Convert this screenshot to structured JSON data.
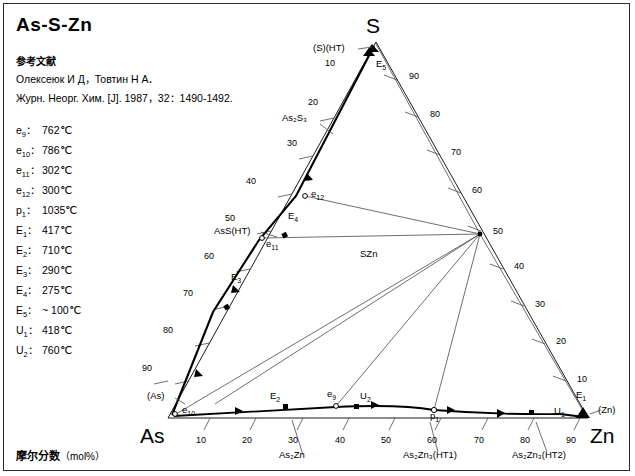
{
  "title": "As-S-Zn",
  "reference": {
    "heading": "参考文献",
    "line1": "Олексеюк И Д，Товтин Н А．",
    "line2": "Журн. Неорг. Хим. [J]. 1987，32：1490-1492."
  },
  "caption": {
    "text": "摩尔分数",
    "unit": "（mol%）"
  },
  "legend": [
    {
      "label": "e",
      "sub": "9",
      "value": "762℃"
    },
    {
      "label": "e",
      "sub": "10",
      "value": "786℃"
    },
    {
      "label": "e",
      "sub": "11",
      "value": "302℃"
    },
    {
      "label": "e",
      "sub": "12",
      "value": "300℃"
    },
    {
      "label": "p",
      "sub": "1",
      "value": "1035℃"
    },
    {
      "label": "E",
      "sub": "1",
      "value": "417℃"
    },
    {
      "label": "E",
      "sub": "2",
      "value": "710℃"
    },
    {
      "label": "E",
      "sub": "3",
      "value": "290℃"
    },
    {
      "label": "E",
      "sub": "4",
      "value": "275℃"
    },
    {
      "label": "E",
      "sub": "5",
      "value": "~ 100℃"
    },
    {
      "label": "U",
      "sub": "1",
      "value": "418℃"
    },
    {
      "label": "U",
      "sub": "2",
      "value": "760℃"
    }
  ],
  "vertices": {
    "top": "S",
    "left": "As",
    "right": "Zn"
  },
  "axis_ticks": {
    "left": [
      "10",
      "20",
      "30",
      "40",
      "50",
      "60",
      "70",
      "80",
      "90"
    ],
    "right": [
      "90",
      "80",
      "70",
      "60",
      "50",
      "40",
      "30",
      "20",
      "10"
    ],
    "bottom": [
      "10",
      "20",
      "30",
      "40",
      "50",
      "60",
      "70",
      "80",
      "90"
    ]
  },
  "phase_labels": [
    {
      "text": "(S)(HT)",
      "sub": ""
    },
    {
      "text": "As",
      "sub": "2",
      "text2": "S",
      "sub2": "3"
    },
    {
      "text": "AsS(HT)"
    },
    {
      "text": "SZn"
    },
    {
      "text": "(As)"
    },
    {
      "text": "(Zn)"
    },
    {
      "text": "As",
      "sub": "2",
      "text2": "Zn"
    },
    {
      "text": "As",
      "sub": "2",
      "text2": "Zn",
      "sub2": "3",
      "text3": "(HT1)"
    },
    {
      "text": "As",
      "sub": "2",
      "text2": "Zn",
      "sub2": "3",
      "text3": "(HT2)"
    }
  ],
  "labels": {
    "s_ht": "(S)(HT)",
    "as2s3": "As₂S₃",
    "ass_ht": "AsS(HT)",
    "szn": "SZn",
    "as_par": "(As)",
    "zn_par": "(Zn)",
    "as2zn": "As₂Zn",
    "as2zn3_ht1": "As₂Zn₃(HT1)",
    "as2zn3_ht2": "As₂Zn₃(HT2)"
  },
  "invariant_points": [
    {
      "name": "E",
      "sub": "5"
    },
    {
      "name": "e",
      "sub": "12"
    },
    {
      "name": "E",
      "sub": "4"
    },
    {
      "name": "e",
      "sub": "11"
    },
    {
      "name": "E",
      "sub": "3"
    },
    {
      "name": "e",
      "sub": "10"
    },
    {
      "name": "E",
      "sub": "2"
    },
    {
      "name": "e",
      "sub": "9"
    },
    {
      "name": "U",
      "sub": "2"
    },
    {
      "name": "p",
      "sub": "1"
    },
    {
      "name": "U",
      "sub": "1"
    },
    {
      "name": "E",
      "sub": "1"
    }
  ],
  "colors": {
    "line": "#000000",
    "thin": "#5a5a5a",
    "frame": "#2b2b2b"
  }
}
